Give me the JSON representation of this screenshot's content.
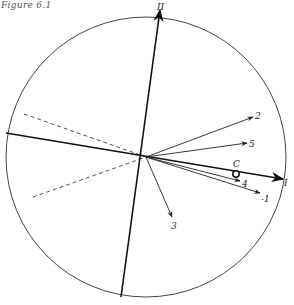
{
  "caption": "Figure 6.1",
  "diagram": {
    "type": "vector-rotation-plot",
    "circle": {
      "cx": 146,
      "cy": 157,
      "r": 140
    },
    "origin": {
      "x": 146,
      "y": 157
    },
    "axes": [
      {
        "id": "II",
        "label": "II",
        "x1": 121,
        "y1": 297,
        "x2": 160,
        "y2": 10,
        "label_x": 157,
        "label_y": 10
      },
      {
        "id": "I",
        "label": "I",
        "x1": 6,
        "y1": 133,
        "x2": 283,
        "y2": 179,
        "label_x": 284,
        "label_y": 186
      }
    ],
    "dashed_lines": [
      {
        "x1": 24,
        "y1": 114,
        "x2": 146,
        "y2": 157
      },
      {
        "x1": 33,
        "y1": 197,
        "x2": 146,
        "y2": 157
      }
    ],
    "vectors": [
      {
        "label": "2",
        "x2": 253,
        "y2": 117,
        "label_x": 255,
        "label_y": 119
      },
      {
        "label": "5",
        "x2": 247,
        "y2": 143,
        "label_x": 249,
        "label_y": 147
      },
      {
        "label": "4",
        "x2": 240,
        "y2": 181,
        "label_x": 242,
        "label_y": 187
      },
      {
        "label": "-1",
        "x2": 260,
        "y2": 193,
        "label_x": 261,
        "label_y": 202
      },
      {
        "label": "3",
        "x2": 172,
        "y2": 217,
        "label_x": 171,
        "label_y": 229
      }
    ],
    "point": {
      "label": "C",
      "x": 236,
      "y": 174,
      "label_x": 233,
      "label_y": 167
    },
    "colors": {
      "stroke": "#222222",
      "circle": "#444444",
      "dash": "#555555"
    }
  }
}
